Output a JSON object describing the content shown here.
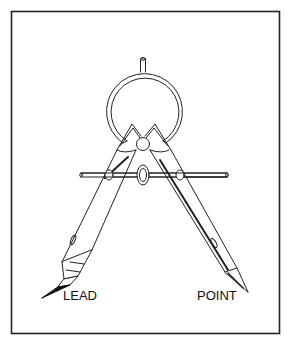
{
  "figure": {
    "border_color": "#222222",
    "line_color": "#222222",
    "labels": {
      "lead": "LEAD",
      "point": "POINT"
    }
  }
}
